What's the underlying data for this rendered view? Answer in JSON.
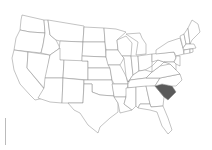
{
  "map": {
    "region": "Contiguous United States",
    "highlighted_state": "South Carolina",
    "colors": {
      "highlight": "#5a5a5a",
      "state_fill": "#ffffff",
      "border": "#888888"
    }
  }
}
